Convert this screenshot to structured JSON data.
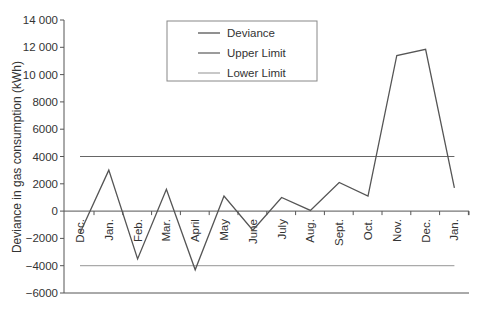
{
  "chart_data": {
    "type": "line",
    "title": "",
    "xlabel": "",
    "ylabel": "Deviance in gas consumption (kWh)",
    "ylim": [
      -6000,
      14000
    ],
    "yticks": [
      14000,
      12000,
      10000,
      8000,
      6000,
      4000,
      2000,
      0,
      -2000,
      -4000,
      -6000
    ],
    "ytick_labels": [
      "14 000",
      "12 000",
      "10 000",
      "8000",
      "6000",
      "4000",
      "2000",
      "0",
      "−2000",
      "−4000",
      "−6000"
    ],
    "categories": [
      "Dec.",
      "Jan.",
      "Feb.",
      "Mar.",
      "April",
      "May",
      "June",
      "July",
      "Aug.",
      "Sept.",
      "Oct.",
      "Nov.",
      "Dec.",
      "Jan."
    ],
    "series": [
      {
        "name": "Deviance",
        "color": "#555555",
        "values": [
          -1600,
          3000,
          -3500,
          1600,
          -4300,
          1100,
          -1400,
          1000,
          50,
          2100,
          1100,
          11400,
          11850,
          1700
        ]
      },
      {
        "name": "Upper Limit",
        "color": "#666666",
        "values": [
          4000,
          4000,
          4000,
          4000,
          4000,
          4000,
          4000,
          4000,
          4000,
          4000,
          4000,
          4000,
          4000,
          4000
        ]
      },
      {
        "name": "Lower Limit",
        "color": "#aaaaaa",
        "values": [
          -4000,
          -4000,
          -4000,
          -4000,
          -4000,
          -4000,
          -4000,
          -4000,
          -4000,
          -4000,
          -4000,
          -4000,
          -4000,
          -4000
        ]
      }
    ],
    "legend": {
      "position": "top-center",
      "entries": [
        "Deviance",
        "Upper Limit",
        "Lower Limit"
      ]
    },
    "grid": false
  }
}
